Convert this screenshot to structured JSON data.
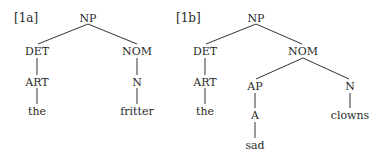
{
  "trees": [
    {
      "label": "[1a]",
      "label_pos": [
        14,
        18
      ],
      "nodes": [
        {
          "id": "np",
          "text": "NP",
          "x": 88,
          "y": 18
        },
        {
          "id": "det",
          "text": "DET",
          "x": 37,
          "y": 51
        },
        {
          "id": "nom",
          "text": "NOM",
          "x": 137,
          "y": 51
        },
        {
          "id": "art",
          "text": "ART",
          "x": 37,
          "y": 82
        },
        {
          "id": "n",
          "text": "N",
          "x": 137,
          "y": 82
        },
        {
          "id": "the",
          "text": "the",
          "x": 37,
          "y": 111
        },
        {
          "id": "fritter",
          "text": "fritter",
          "x": 137,
          "y": 111
        }
      ],
      "edges": [
        [
          88,
          24,
          38,
          44
        ],
        [
          88,
          24,
          137,
          44
        ],
        [
          37,
          58,
          37,
          75
        ],
        [
          137,
          58,
          137,
          75
        ],
        [
          37,
          88,
          37,
          104
        ],
        [
          137,
          88,
          137,
          104
        ]
      ]
    },
    {
      "label": "[1b]",
      "label_pos": [
        176,
        18
      ],
      "nodes": [
        {
          "id": "np",
          "text": "NP",
          "x": 256,
          "y": 18
        },
        {
          "id": "det",
          "text": "DET",
          "x": 205,
          "y": 51
        },
        {
          "id": "nom",
          "text": "NOM",
          "x": 303,
          "y": 51
        },
        {
          "id": "art",
          "text": "ART",
          "x": 205,
          "y": 82
        },
        {
          "id": "the",
          "text": "the",
          "x": 205,
          "y": 111
        },
        {
          "id": "ap",
          "text": "AP",
          "x": 255,
          "y": 86
        },
        {
          "id": "n",
          "text": "N",
          "x": 350,
          "y": 86
        },
        {
          "id": "a",
          "text": "A",
          "x": 255,
          "y": 115
        },
        {
          "id": "sad",
          "text": "sad",
          "x": 255,
          "y": 145
        },
        {
          "id": "clowns",
          "text": "clowns",
          "x": 350,
          "y": 115
        }
      ],
      "edges": [
        [
          256,
          24,
          206,
          44
        ],
        [
          256,
          24,
          302,
          44
        ],
        [
          205,
          58,
          205,
          75
        ],
        [
          205,
          88,
          205,
          104
        ],
        [
          303,
          58,
          256,
          79
        ],
        [
          303,
          58,
          349,
          79
        ],
        [
          255,
          93,
          255,
          108
        ],
        [
          255,
          122,
          255,
          138
        ],
        [
          350,
          93,
          350,
          108
        ]
      ]
    }
  ],
  "colors": {
    "text": "#2a2a2a",
    "line": "#333333",
    "background": "#ffffff"
  }
}
